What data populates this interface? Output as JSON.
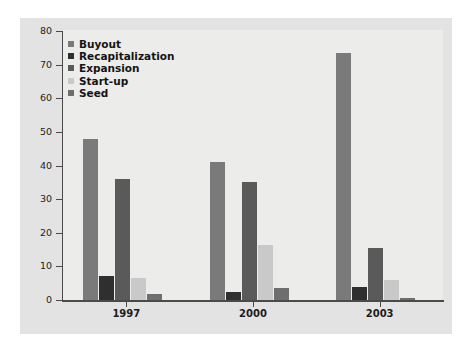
{
  "chart_data": {
    "type": "bar",
    "title": "",
    "subtitle": "",
    "xlabel": "",
    "ylabel": "",
    "categories": [
      "1997",
      "2000",
      "2003"
    ],
    "series": [
      {
        "name": "Buyout",
        "color": "#7a7a7a",
        "values": [
          48,
          41,
          73.5
        ]
      },
      {
        "name": "Recapitalization",
        "color": "#2f2f2f",
        "values": [
          7,
          2.5,
          4
        ]
      },
      {
        "name": "Expansion",
        "color": "#5a5a5a",
        "values": [
          36,
          35,
          15.5
        ]
      },
      {
        "name": "Start-up",
        "color": "#c9c9c9",
        "values": [
          6.5,
          16.5,
          6
        ]
      },
      {
        "name": "Seed",
        "color": "#6e6e6e",
        "values": [
          1.8,
          3.5,
          0.5
        ]
      }
    ],
    "ylim": [
      0,
      80
    ],
    "yticks": [
      0,
      10,
      20,
      30,
      40,
      50,
      60,
      70,
      80
    ],
    "ytick_labels": [
      "0",
      "10",
      "20",
      "30",
      "40",
      "50",
      "60",
      "70",
      "80"
    ],
    "grid": false,
    "legend_position": "top-left",
    "panel_color": "#e3e3e3",
    "plot_color": "#ececeb",
    "axis_color": "#4a4a4a",
    "background": "#ffffff"
  }
}
